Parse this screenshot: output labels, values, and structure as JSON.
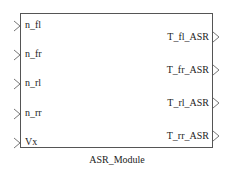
{
  "block": {
    "name": "ASR_Module",
    "inputs": [
      "n_fl",
      "n_fr",
      "n_rl",
      "n_rr",
      "Vx"
    ],
    "outputs": [
      "T_fl_ASR",
      "T_fr_ASR",
      "T_rl_ASR",
      "T_rr_ASR"
    ]
  }
}
